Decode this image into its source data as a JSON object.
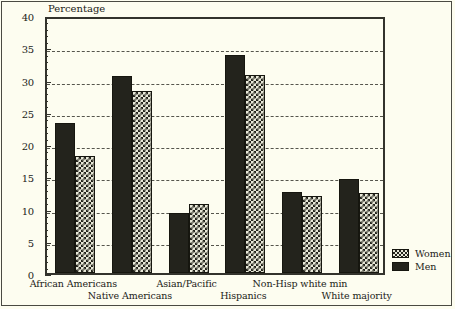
{
  "chart": {
    "ylabel": "Percentage",
    "ytick_labels": [
      "0",
      "5",
      "10",
      "15",
      "20",
      "25",
      "30",
      "35",
      "40"
    ],
    "legend": {
      "items": [
        {
          "label": "Women",
          "swatch": "checkered-pattern"
        },
        {
          "label": "Men",
          "swatch": "solid-dark"
        }
      ]
    }
  },
  "chart_data": {
    "type": "bar",
    "title": "",
    "xlabel": "",
    "ylabel": "Percentage",
    "ylim": [
      0,
      40
    ],
    "ytick_step": 5,
    "grid": true,
    "legend_position": "right-bottom-outside",
    "categories": [
      "African Americans",
      "Native Americans",
      "Asian/Pacific",
      "Hispanics",
      "Non-Hisp white min",
      "White majority"
    ],
    "series": [
      {
        "name": "Men",
        "values": [
          23.2,
          30.5,
          9.3,
          33.8,
          12.5,
          14.5
        ]
      },
      {
        "name": "Women",
        "values": [
          18.2,
          28.2,
          10.7,
          30.7,
          12.0,
          12.4
        ]
      }
    ]
  }
}
